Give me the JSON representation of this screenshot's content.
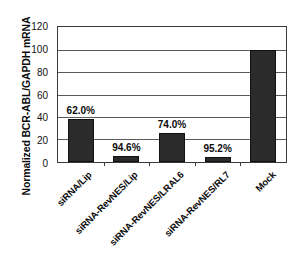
{
  "chart_data": {
    "type": "bar",
    "title": "",
    "xlabel": "",
    "ylabel": "Normalized BCR-ABL/GAPDH mRNA",
    "ylim": [
      0,
      120
    ],
    "yticks": [
      0,
      20,
      40,
      60,
      80,
      100,
      120
    ],
    "grid": true,
    "legend": null,
    "categories": [
      "siRNA/Lip",
      "siRNA-RevNES/Lip",
      "siRNA-RevNES/LRAL6",
      "siRNA-RevNES/RL7",
      "Mock"
    ],
    "values": [
      38.0,
      5.4,
      26.0,
      4.8,
      100.0
    ],
    "annotations": [
      "62.0%",
      "94.6%",
      "74.0%",
      "95.2%",
      ""
    ],
    "bar_color": "#2b2b2b"
  }
}
